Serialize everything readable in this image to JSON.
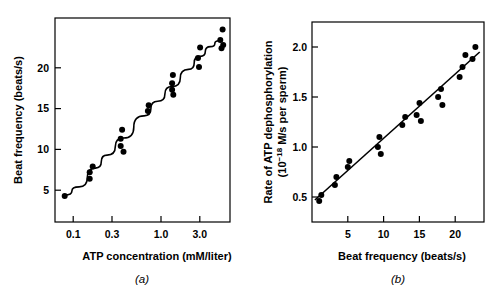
{
  "figure": {
    "panel_a_letter": "(a)",
    "panel_b_letter": "(b)"
  },
  "chart_data": [
    {
      "type": "scatter",
      "panel": "(a)",
      "title": "",
      "xlabel": "ATP concentration (mM/liter)",
      "ylabel": "Beat frequency (beats/s)",
      "xscale": "log",
      "xlim": [
        0.055,
        4.2
      ],
      "ylim": [
        0,
        25
      ],
      "xticks": [
        0.1,
        0.3,
        1.0,
        3.0
      ],
      "xtick_labels": [
        "0.1",
        "0.3",
        "1.0",
        "3.0"
      ],
      "yticks": [
        5,
        10,
        15,
        20
      ],
      "ytick_labels": [
        "5",
        "10",
        "15",
        "20"
      ],
      "grid": false,
      "legend": "none",
      "points": [
        {
          "x": 0.07,
          "y": 3.2
        },
        {
          "x": 0.13,
          "y": 6.1
        },
        {
          "x": 0.13,
          "y": 5.3
        },
        {
          "x": 0.14,
          "y": 6.8
        },
        {
          "x": 0.28,
          "y": 10.2
        },
        {
          "x": 0.28,
          "y": 9.3
        },
        {
          "x": 0.29,
          "y": 11.3
        },
        {
          "x": 0.3,
          "y": 8.6
        },
        {
          "x": 0.55,
          "y": 13.6
        },
        {
          "x": 0.56,
          "y": 14.3
        },
        {
          "x": 1.0,
          "y": 17.0
        },
        {
          "x": 1.0,
          "y": 16.2
        },
        {
          "x": 1.02,
          "y": 18.0
        },
        {
          "x": 1.03,
          "y": 15.6
        },
        {
          "x": 1.9,
          "y": 20.1
        },
        {
          "x": 1.95,
          "y": 19.0
        },
        {
          "x": 2.0,
          "y": 21.4
        },
        {
          "x": 3.3,
          "y": 22.3
        },
        {
          "x": 3.4,
          "y": 21.3
        },
        {
          "x": 3.5,
          "y": 23.6
        },
        {
          "x": 3.55,
          "y": 21.7
        }
      ],
      "fit_curve": [
        {
          "x": 0.07,
          "y": 3.3
        },
        {
          "x": 0.1,
          "y": 4.3
        },
        {
          "x": 0.15,
          "y": 6.6
        },
        {
          "x": 0.2,
          "y": 8.2
        },
        {
          "x": 0.3,
          "y": 10.3
        },
        {
          "x": 0.5,
          "y": 13.0
        },
        {
          "x": 0.7,
          "y": 14.8
        },
        {
          "x": 1.0,
          "y": 16.6
        },
        {
          "x": 1.5,
          "y": 18.7
        },
        {
          "x": 2.0,
          "y": 20.3
        },
        {
          "x": 2.6,
          "y": 21.5
        },
        {
          "x": 3.2,
          "y": 22.2
        },
        {
          "x": 3.5,
          "y": 22.4
        }
      ]
    },
    {
      "type": "scatter",
      "panel": "(b)",
      "title": "",
      "xlabel": "Beat frequency (beats/s)",
      "ylabel": "Rate of ATP dephosphorylation (10^-18 M/s per sperm)",
      "ylabel_line1": "Rate of ATP dephosphorylation",
      "ylabel_line2": "(10",
      "ylabel_exponent": "−18",
      "ylabel_line3": " M/s per sperm)",
      "xscale": "linear",
      "xlim": [
        0,
        24
      ],
      "ylim": [
        0.25,
        2.25
      ],
      "xticks": [
        5,
        10,
        15,
        20
      ],
      "xtick_labels": [
        "5",
        "10",
        "15",
        "20"
      ],
      "yticks": [
        0.5,
        1.0,
        1.5,
        2.0
      ],
      "ytick_labels": [
        "0.5",
        "1.0",
        "1.5",
        "2.0"
      ],
      "grid": false,
      "legend": "none",
      "points": [
        {
          "x": 1.0,
          "y": 0.46
        },
        {
          "x": 1.3,
          "y": 0.52
        },
        {
          "x": 3.2,
          "y": 0.62
        },
        {
          "x": 3.4,
          "y": 0.7
        },
        {
          "x": 5.0,
          "y": 0.8
        },
        {
          "x": 5.2,
          "y": 0.86
        },
        {
          "x": 9.2,
          "y": 1.0
        },
        {
          "x": 9.4,
          "y": 1.1
        },
        {
          "x": 9.6,
          "y": 0.93
        },
        {
          "x": 12.6,
          "y": 1.22
        },
        {
          "x": 13.0,
          "y": 1.3
        },
        {
          "x": 14.6,
          "y": 1.32
        },
        {
          "x": 15.0,
          "y": 1.44
        },
        {
          "x": 15.2,
          "y": 1.26
        },
        {
          "x": 17.6,
          "y": 1.5
        },
        {
          "x": 18.0,
          "y": 1.58
        },
        {
          "x": 18.2,
          "y": 1.42
        },
        {
          "x": 20.6,
          "y": 1.7
        },
        {
          "x": 21.0,
          "y": 1.8
        },
        {
          "x": 21.4,
          "y": 1.92
        },
        {
          "x": 22.4,
          "y": 1.88
        },
        {
          "x": 22.8,
          "y": 2.0
        }
      ],
      "fit_line": {
        "x0": 0.4,
        "y0": 0.47,
        "x1": 23.4,
        "y1": 1.95
      }
    }
  ]
}
